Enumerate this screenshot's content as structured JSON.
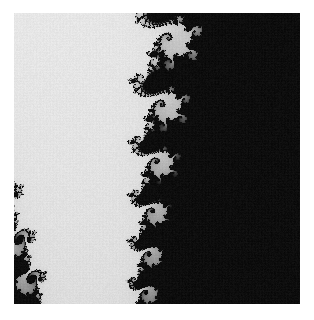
{
  "page": {
    "width": 314,
    "height": 320,
    "background_color": "#ffffff",
    "title": "Mandelbrot Set Fractal Render"
  },
  "figure": {
    "name": "fractal-image",
    "x": 14,
    "y": 13,
    "width": 286,
    "height": 291,
    "background_color": "#d9d9d9",
    "interior_color": "#0d0d0d",
    "filament_color": "#5a5a5a",
    "halo_color": "#ededed",
    "caption": ""
  },
  "chart_data": {
    "type": "heatmap",
    "title": "",
    "subtitle": "",
    "xlabel": "",
    "ylabel": "",
    "render": "mandelbrot-escape-time",
    "colormap": "grayscale-inverted",
    "grid": false,
    "legend": "none",
    "max_iterations": 90,
    "escape_radius": 2.0,
    "complex_plane": {
      "center_real": -0.745,
      "center_imag": 0.113,
      "view_width": 0.044,
      "view_height": 0.044,
      "xlim": [
        -0.767,
        -0.723
      ],
      "ylim": [
        0.091,
        0.135
      ]
    },
    "value_range": [
      0,
      90
    ],
    "color_stops": [
      {
        "iteration": 0,
        "hex": "#f2f2f2"
      },
      {
        "iteration": 20,
        "hex": "#dcdcdc"
      },
      {
        "iteration": 40,
        "hex": "#bdbdbd"
      },
      {
        "iteration": 60,
        "hex": "#8c8c8c"
      },
      {
        "iteration": 80,
        "hex": "#3c3c3c"
      },
      {
        "iteration": 90,
        "hex": "#0d0d0d"
      }
    ],
    "pixel_grid": {
      "cols": 286,
      "rows": 291
    }
  }
}
